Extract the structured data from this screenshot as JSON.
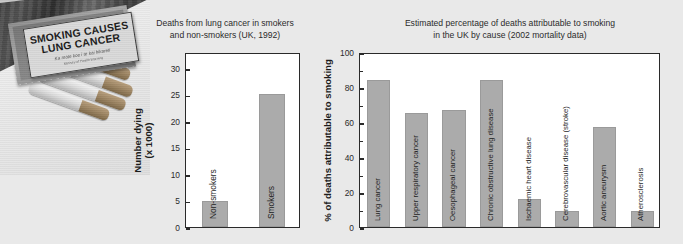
{
  "photo": {
    "alt_name": "cigarette-pack-photograph",
    "warning_label": {
      "line1": "SMOKING CAUSES",
      "line2": "LUNG CANCER",
      "line3": "Ka mate koe i te kai hikareti",
      "line4": "Ministry of Health Warning"
    }
  },
  "chart_data": [
    {
      "type": "bar",
      "id": "lung-cancer-deaths",
      "title": "Deaths from lung cancer in smokers\nand non-smokers (UK, 1992)",
      "xlabel": "",
      "ylabel": "Number dying\n(x 1000)",
      "ylim": [
        0,
        33
      ],
      "yticks": [
        0,
        5,
        10,
        15,
        20,
        25,
        30
      ],
      "ytick_labels": [
        "0",
        "5",
        "10",
        "15",
        "20",
        "25",
        "30"
      ],
      "grid": false,
      "legend": "none",
      "categories": [
        "Non-smokers",
        "Smokers"
      ],
      "values": [
        5,
        25
      ],
      "bar_color": "#ababab"
    },
    {
      "type": "bar",
      "id": "deaths-attributable-to-smoking",
      "title": "Estimated percentage of deaths attributable to smoking\nin the UK by cause (2002 mortality data)",
      "xlabel": "",
      "ylabel": "% of deaths attributable to smoking",
      "ylim": [
        0,
        100
      ],
      "yticks": [
        0,
        20,
        40,
        60,
        80,
        100
      ],
      "ytick_labels": [
        "0",
        "20",
        "40",
        "60",
        "80",
        "100"
      ],
      "minor_yticks": [
        10,
        30,
        50,
        70,
        90
      ],
      "grid": false,
      "legend": "none",
      "categories": [
        "Lung cancer",
        "Upper respiratory cancer",
        "Oesophageal cancer",
        "Chronic obstructive lung disease",
        "Ischaemic heart disease",
        "Cerebrovascular disease (stroke)",
        "Aortic aneurysm",
        "Atherosclerosis"
      ],
      "values": [
        84,
        65,
        67,
        84,
        16,
        9,
        57,
        9
      ],
      "bar_color": "#ababab"
    }
  ],
  "colors": {
    "background": "#e9e9e9",
    "plot_background": "#ffffff",
    "axis": "#2a2a2a",
    "bar": "#ababab",
    "text": "#2b2b2b"
  }
}
